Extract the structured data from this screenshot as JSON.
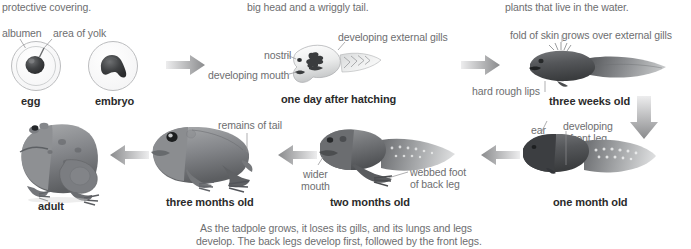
{
  "diagram": {
    "title_semantic": "frog-life-cycle-metamorphosis",
    "continuation_texts": [
      {
        "id": "col1_top",
        "text": "protective covering."
      },
      {
        "id": "col2_top",
        "text": "big head and a wriggly tail."
      },
      {
        "id": "col3_top",
        "text": "plants that live in the water."
      }
    ],
    "annotations": {
      "albumen": "albumen",
      "area_of_yolk": "area of yolk",
      "developing_external_gills": "developing external gills",
      "nostril": "nostril",
      "developing_mouth": "developing mouth",
      "fold_of_skin": "fold of skin grows over external gills",
      "hard_rough_lips": "hard rough lips",
      "ear": "ear",
      "developing_front_leg_line1": "developing",
      "developing_front_leg_line2": "front leg",
      "remains_of_tail": "remains of tail",
      "wider_mouth_line1": "wider",
      "wider_mouth_line2": "mouth",
      "webbed_foot_line1": "webbed foot",
      "webbed_foot_line2": "of back leg"
    },
    "stages": [
      {
        "id": "egg",
        "label": "egg"
      },
      {
        "id": "embryo",
        "label": "embryo"
      },
      {
        "id": "one-day-after-hatching",
        "label": "one day after hatching"
      },
      {
        "id": "three-weeks-old",
        "label": "three weeks old"
      },
      {
        "id": "one-month-old",
        "label": "one month old"
      },
      {
        "id": "two-months-old",
        "label": "two months old"
      },
      {
        "id": "three-months-old",
        "label": "three months old"
      },
      {
        "id": "adult",
        "label": "adult"
      }
    ],
    "caption": {
      "line1": "As the tadpole grows, it loses its gills, and its lungs and legs",
      "line2": "develop. The back legs develop first, followed by the front legs."
    },
    "colors": {
      "label_text": "#6d6e70",
      "stage_text": "#2b2b2b",
      "arrow_dark": "#8a8b8d",
      "arrow_light": "#e9eaea",
      "body_dark": "#4a4c4e",
      "body_mid": "#77797b",
      "body_light": "#b9bbbd",
      "egg_outline": "#a7a9ac",
      "yolk": "#3b3c3e",
      "background": "#ffffff"
    },
    "arrows": [
      {
        "id": "arrow-egg-to-hatchling",
        "direction": "right"
      },
      {
        "id": "arrow-hatchling-to-three-weeks",
        "direction": "right"
      },
      {
        "id": "arrow-three-weeks-to-one-month",
        "direction": "down"
      },
      {
        "id": "arrow-one-month-to-two-months",
        "direction": "left"
      },
      {
        "id": "arrow-two-months-to-three-months",
        "direction": "left"
      },
      {
        "id": "arrow-three-months-to-adult",
        "direction": "left"
      }
    ]
  }
}
